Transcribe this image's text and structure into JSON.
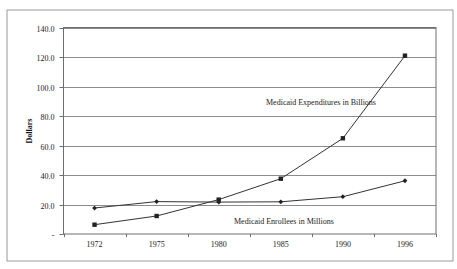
{
  "chart_data": {
    "type": "line",
    "title": "",
    "xlabel": "",
    "ylabel": "Dollars",
    "categories": [
      "1972",
      "1975",
      "1980",
      "1985",
      "1990",
      "1996"
    ],
    "ylim": [
      0,
      140
    ],
    "yticks": [
      0,
      20,
      40,
      60,
      80,
      100,
      120,
      140
    ],
    "ytick_labels": [
      "-",
      "20.0",
      "40.0",
      "60.0",
      "80.0",
      "100.0",
      "120.0",
      "140.0"
    ],
    "grid": true,
    "legend": "none (inline series labels)",
    "series": [
      {
        "name": "Medicaid Expenditures in Billions",
        "marker": "square",
        "values": [
          6.3,
          12.2,
          23.3,
          37.5,
          64.9,
          120.9
        ]
      },
      {
        "name": "Medicaid Enrollees in Millions",
        "marker": "diamond",
        "values": [
          17.6,
          22.0,
          21.6,
          21.8,
          25.3,
          36.1
        ]
      }
    ],
    "annotations": [
      {
        "text": "Medicaid Expenditures in Billions",
        "series": 0
      },
      {
        "text": "Medicaid Enrollees in Millions",
        "series": 1
      }
    ]
  }
}
